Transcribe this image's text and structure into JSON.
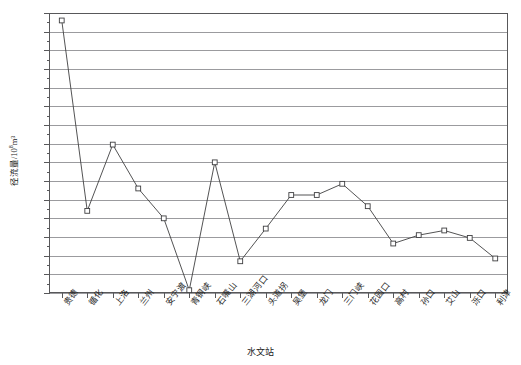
{
  "chart_data": {
    "type": "line",
    "title": "",
    "xlabel": "水文站",
    "ylabel": "径流量/10⁸m³",
    "ylabel_base": "径流量/10",
    "ylabel_exp": "8",
    "ylabel_unit": "m³",
    "ylim": [
      -80,
      220
    ],
    "ytick_step": 20,
    "yticks": [
      220,
      200,
      180,
      160,
      140,
      120,
      100,
      80,
      60,
      40,
      20,
      0,
      -20,
      -40,
      -60,
      -80
    ],
    "ytick_labels": [
      "220",
      "200",
      "180",
      "160",
      "140",
      "120",
      "100",
      "80",
      "60",
      "40",
      "20",
      "0",
      "-20",
      "-40",
      "-60",
      "-80"
    ],
    "grid": true,
    "grid_orientation": "horizontal",
    "legend": false,
    "marker": "open-square",
    "line_color": "#3f3f41",
    "marker_color": "#3f3f41",
    "categories": [
      "贵德",
      "循化",
      "上洛",
      "兰州",
      "安宁渡",
      "青铜峡",
      "石嘴山",
      "三湖河口",
      "头道拐",
      "吴堡",
      "龙门",
      "三门峡",
      "花园口",
      "高村",
      "孙口",
      "艾山",
      "泺口",
      "利津"
    ],
    "values": [
      212,
      8,
      79,
      32,
      0,
      -77,
      60,
      -46,
      -11,
      25,
      25,
      37,
      13,
      -27,
      -18,
      -13,
      -21,
      -43
    ],
    "series": [
      {
        "name": "径流量",
        "values": [
          212,
          8,
          79,
          32,
          0,
          -77,
          60,
          -46,
          -11,
          25,
          25,
          37,
          13,
          -27,
          -18,
          -13,
          -21,
          -43
        ]
      }
    ]
  }
}
